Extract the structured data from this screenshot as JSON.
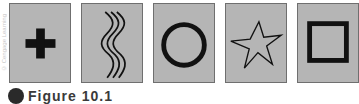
{
  "credit": "© Cengage Learning",
  "cards": [
    {
      "symbol": "plus"
    },
    {
      "symbol": "wavy-lines"
    },
    {
      "symbol": "circle"
    },
    {
      "symbol": "star"
    },
    {
      "symbol": "square"
    }
  ],
  "caption": {
    "label": "Figure 10.1"
  },
  "colors": {
    "card_fill": "#b5b5b5",
    "card_border": "#6f6f6f",
    "symbol": "#111111"
  }
}
